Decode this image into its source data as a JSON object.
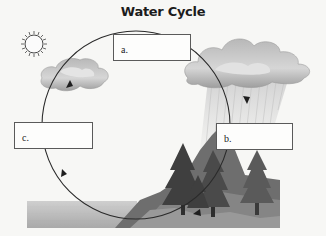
{
  "title": "Water Cycle",
  "labels": [
    {
      "id": "a",
      "text": "a.",
      "value": ""
    },
    {
      "id": "b",
      "text": "b.",
      "value": ""
    },
    {
      "id": "c",
      "text": "c.",
      "value": ""
    }
  ],
  "icons": [
    "sun-icon",
    "small-cloud-icon",
    "rain-cloud-icon",
    "rain-icon",
    "trees-icon",
    "hill-icon",
    "water-icon",
    "cycle-arrow-icon"
  ],
  "colors": {
    "background": "#f7f7f5",
    "cycle_line": "#2a2a2a",
    "box_border": "#5a5a5a",
    "cloud": "#c8c8c8",
    "tree": "#4a4a4a",
    "water": "#b5b5b5"
  }
}
